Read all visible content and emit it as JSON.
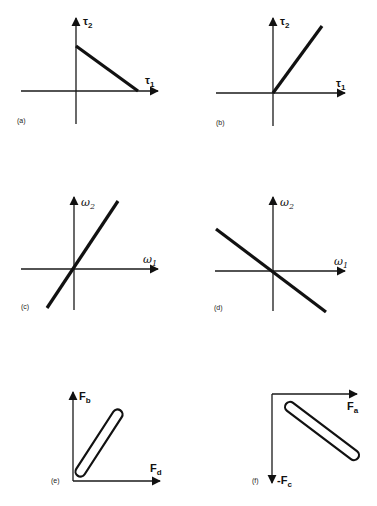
{
  "panels": [
    {
      "id": "a",
      "caption": "(a)",
      "x_label": "τ",
      "x_sub": "1",
      "y_label": "τ",
      "y_sub": "2",
      "curve": "line, negative slope, from positive τ2 intercept to positive τ1 intercept"
    },
    {
      "id": "b",
      "caption": "(b)",
      "x_label": "τ",
      "x_sub": "1",
      "y_label": "τ",
      "y_sub": "2",
      "curve": "ray from origin, positive slope, first quadrant"
    },
    {
      "id": "c",
      "caption": "(c)",
      "x_label": "ω",
      "x_sub": "1",
      "y_label": "ω",
      "y_sub": "2",
      "curve": "line through origin, positive slope"
    },
    {
      "id": "d",
      "caption": "(d)",
      "x_label": "ω",
      "x_sub": "1",
      "y_label": "ω",
      "y_sub": "2",
      "curve": "line through origin, negative slope"
    },
    {
      "id": "e",
      "caption": "(e)",
      "x_label": "F",
      "x_sub": "d",
      "y_label": "F",
      "y_sub": "b",
      "curve": "narrow elongated loop, positive slope"
    },
    {
      "id": "f",
      "caption": "(f)",
      "x_label": "F",
      "x_sub": "a",
      "y_label": "-F",
      "y_sub": "c",
      "curve": "narrow elongated loop, negative-y axis downward"
    }
  ]
}
